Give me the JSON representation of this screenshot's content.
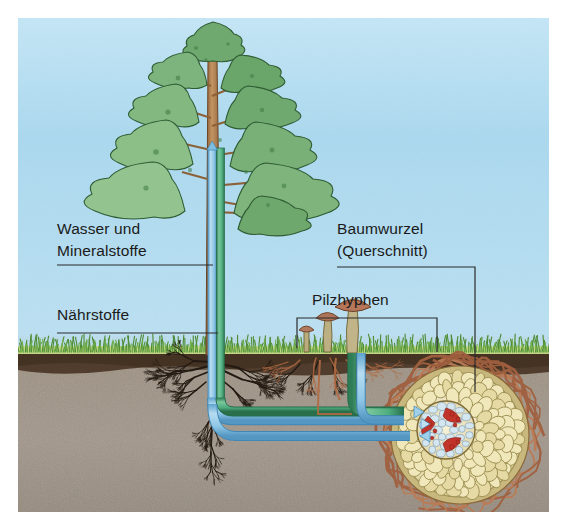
{
  "figure": {
    "language": "de",
    "canvas": {
      "width": 567,
      "height": 528
    }
  },
  "labels": [
    {
      "id": "wasser-mineralstoffe",
      "line1": "Wasser und",
      "line2": "Mineralstoffe",
      "x": 57,
      "y": 233,
      "leader_y": 265,
      "leader_x1": 57,
      "leader_x2": 213
    },
    {
      "id": "naehrstoffe",
      "line1": "Nährstoffe",
      "line2": "",
      "x": 57,
      "y": 319,
      "leader_y": 333,
      "leader_x1": 57,
      "leader_x2": 216
    },
    {
      "id": "baumwurzel-querschnitt",
      "line1": "Baumwurzel",
      "line2": "(Querschnitt)",
      "x": 337,
      "y": 233,
      "leader_y": 278,
      "leader_x1": 337,
      "leader_x2": 475,
      "drop_to_y": 392
    },
    {
      "id": "pilzhyphen",
      "line1": "Pilzhyphen",
      "line2": "",
      "x": 308,
      "y": 305,
      "bracket_y": 318,
      "bracket_x1": 297,
      "bracket_x2": 437,
      "bracket_drop": 352
    }
  ],
  "scene": {
    "sky_color": "#a9d7ee",
    "sky_top_color": "#bde2f4",
    "grass_color": "#5d9a3e",
    "grass_band_color": "#c6d98a",
    "topsoil_color": "#4a3526",
    "soil_color": "#9d9283",
    "soil_dark_color": "#8a7f70",
    "horizon_y": 352,
    "tree": {
      "foliage_color": "#7cb07a",
      "foliage_dark_color": "#4e8a54",
      "foliage_outline": "#2f5c33",
      "trunk_color": "#a87a4e",
      "trunk_outline": "#6b4524",
      "trunk_x": 213,
      "crown_top_y": 22
    },
    "pipes": {
      "water_label": "Wasser und Mineralstoffe",
      "water_color": "#8fc8e8",
      "water_edge_color": "#4a93c4",
      "nutrient_label": "Nährstoffe",
      "nutrient_color": "#57b082",
      "nutrient_edge_color": "#2c7a54",
      "arrow_up_at_trunk": true
    },
    "mushrooms": [
      {
        "cx": 306,
        "cap_w": 13,
        "stem_h": 24,
        "cap_color": "#b07a5e"
      },
      {
        "cx": 327,
        "cap_w": 21,
        "stem_h": 36,
        "cap_color": "#ad7458"
      },
      {
        "cx": 352,
        "cap_w": 33,
        "stem_h": 48,
        "cap_color": "#b5765a"
      }
    ],
    "root_cross_section": {
      "cx": 460,
      "cy": 435,
      "r": 68,
      "cortex_color": "#e8dfae",
      "cell_color": "#efe6b8",
      "cell_outline": "#9a8c4e",
      "epidermis_color": "#cdbe82",
      "stele_color": "#f0e9cc",
      "xylem_color": "#c0342a",
      "hyphae_color": "#a86a4a"
    },
    "fine_roots_color": "#231a12",
    "hyphae_soil_color": "#b06a42"
  }
}
